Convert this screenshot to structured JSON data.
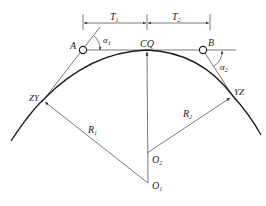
{
  "diagram": {
    "type": "compound circular curve geometry",
    "labels": {
      "T1": "T",
      "T1_sub": "1",
      "T2": "T",
      "T2_sub": "2",
      "A": "A",
      "B": "B",
      "CQ": "CQ",
      "alpha1": "α",
      "alpha1_sub": "1",
      "alpha2": "α",
      "alpha2_sub": "2",
      "ZY": "ZY",
      "YZ": "YZ",
      "R1": "R",
      "R1_sub": "1",
      "R2": "R",
      "R2_sub": "2",
      "O1": "O",
      "O1_sub": "1",
      "O2": "O",
      "O2_sub": "2"
    },
    "colors": {
      "curve": "#1a1a1a",
      "lines": "#555555",
      "text": "#222222"
    }
  }
}
